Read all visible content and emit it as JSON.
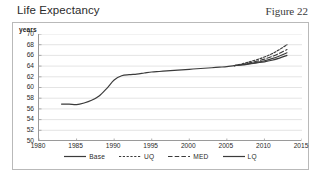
{
  "header": {
    "title": "Life Expectancy",
    "figure_caption": "Figure 22"
  },
  "colors": {
    "line": "#3b3b3b",
    "grid": "#d8d8d8",
    "axis": "#9a9a9a",
    "panel_border": "#b9b9b9",
    "text": "#2a2a2a",
    "background": "#ffffff"
  },
  "chart_data": {
    "type": "line",
    "title": "Life Expectancy",
    "xlabel": "",
    "ylabel": "years",
    "xlim": [
      1980,
      2015
    ],
    "ylim": [
      50,
      70
    ],
    "xticks": [
      1980,
      1985,
      1990,
      1995,
      2000,
      2005,
      2010,
      2015
    ],
    "yticks": [
      50,
      52,
      54,
      56,
      58,
      60,
      62,
      64,
      66,
      68,
      70
    ],
    "grid": "horizontal",
    "legend_position": "bottom",
    "series": [
      {
        "name": "Base",
        "style": "solid",
        "x": [
          1983,
          1984,
          1985,
          1986,
          1987,
          1988,
          1989,
          1990,
          1991,
          1992,
          1993,
          1994,
          1995,
          1996,
          1997,
          1998,
          1999,
          2000,
          2001,
          2002,
          2003,
          2004,
          2005,
          2006,
          2007,
          2008,
          2009,
          2010,
          2011,
          2012,
          2013
        ],
        "values": [
          56.9,
          56.9,
          56.8,
          57.1,
          57.6,
          58.4,
          59.8,
          61.4,
          62.2,
          62.4,
          62.5,
          62.7,
          62.9,
          63.0,
          63.1,
          63.2,
          63.3,
          63.4,
          63.5,
          63.6,
          63.7,
          63.8,
          63.9,
          64.1,
          64.2,
          64.4,
          64.6,
          64.8,
          65.1,
          65.5,
          66.0
        ]
      },
      {
        "name": "UQ",
        "style": "dotted",
        "x": [
          2006,
          2007,
          2008,
          2009,
          2010,
          2011,
          2012,
          2013
        ],
        "values": [
          64.1,
          64.4,
          64.8,
          65.2,
          65.7,
          66.3,
          67.1,
          68.0
        ]
      },
      {
        "name": "MED",
        "style": "dashed",
        "x": [
          2006,
          2007,
          2008,
          2009,
          2010,
          2011,
          2012,
          2013
        ],
        "values": [
          64.1,
          64.3,
          64.6,
          64.9,
          65.3,
          65.8,
          66.4,
          67.1
        ]
      },
      {
        "name": "LQ",
        "style": "solid",
        "x": [
          2006,
          2007,
          2008,
          2009,
          2010,
          2011,
          2012,
          2013
        ],
        "values": [
          64.1,
          64.25,
          64.45,
          64.7,
          65.0,
          65.4,
          65.9,
          66.5
        ]
      }
    ]
  },
  "legend": {
    "items": [
      {
        "label": "Base",
        "style": "solid"
      },
      {
        "label": "UQ",
        "style": "dotted"
      },
      {
        "label": "MED",
        "style": "dashed"
      },
      {
        "label": "LQ",
        "style": "solid"
      }
    ]
  }
}
